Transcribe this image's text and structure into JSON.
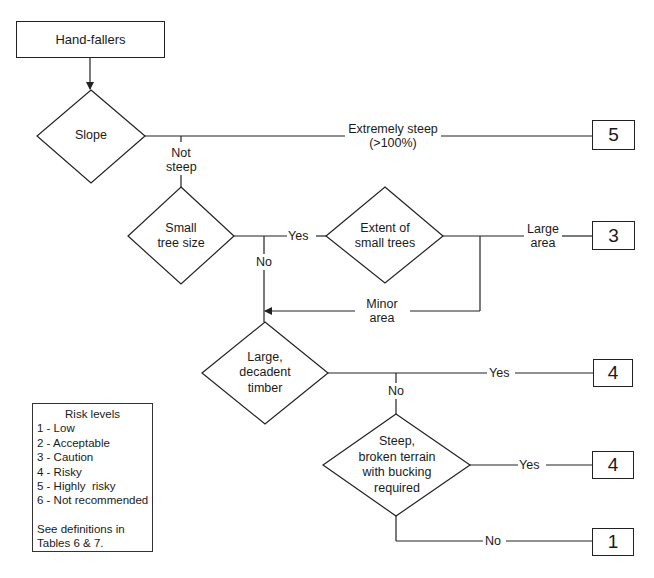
{
  "diagram": {
    "type": "decision-flowchart",
    "start": {
      "label": "Hand-fallers"
    },
    "decisions": [
      {
        "id": "slope",
        "lines": [
          "Slope"
        ]
      },
      {
        "id": "small-tree-size",
        "lines": [
          "Small",
          "tree size"
        ]
      },
      {
        "id": "extent-small-trees",
        "lines": [
          "Extent of",
          "small trees"
        ]
      },
      {
        "id": "large-decadent-timber",
        "lines": [
          "Large,",
          "decadent",
          "timber"
        ]
      },
      {
        "id": "steep-broken-terrain",
        "lines": [
          "Steep,",
          "broken terrain",
          "with bucking",
          "required"
        ]
      }
    ],
    "edge_labels": {
      "extremely_steep_1": "Extremely steep",
      "extremely_steep_2": "(>100%)",
      "not_steep_1": "Not",
      "not_steep_2": "steep",
      "small_yes": "Yes",
      "small_no": "No",
      "large_area_1": "Large",
      "large_area_2": "area",
      "minor_area_1": "Minor",
      "minor_area_2": "area",
      "decadent_yes": "Yes",
      "decadent_no": "No",
      "terrain_yes": "Yes",
      "terrain_no": "No"
    },
    "results": {
      "extremely_steep": "5",
      "large_area": "3",
      "decadent_yes": "4",
      "terrain_yes": "4",
      "terrain_no": "1"
    },
    "edges": [
      {
        "from": "Hand-fallers",
        "to": "Slope"
      },
      {
        "from": "Slope",
        "to": "5",
        "label": "Extremely steep (>100%)"
      },
      {
        "from": "Slope",
        "to": "Small tree size",
        "label": "Not steep"
      },
      {
        "from": "Small tree size",
        "to": "Extent of small trees",
        "label": "Yes"
      },
      {
        "from": "Small tree size",
        "to": "Large, decadent timber",
        "label": "No"
      },
      {
        "from": "Extent of small trees",
        "to": "3",
        "label": "Large area"
      },
      {
        "from": "Extent of small trees",
        "to": "Large, decadent timber",
        "label": "Minor area"
      },
      {
        "from": "Large, decadent timber",
        "to": "4",
        "label": "Yes"
      },
      {
        "from": "Large, decadent timber",
        "to": "Steep, broken terrain with bucking required",
        "label": "No"
      },
      {
        "from": "Steep, broken terrain with bucking required",
        "to": "4",
        "label": "Yes"
      },
      {
        "from": "Steep, broken terrain with bucking required",
        "to": "1",
        "label": "No"
      }
    ]
  },
  "legend": {
    "title": "Risk levels",
    "items": [
      "1 - Low",
      "2 - Acceptable",
      "3 - Caution",
      "4 - Risky",
      "5 - Highly  risky",
      "6 - Not recommended"
    ],
    "note_1": "See definitions in",
    "note_2": "Tables 6 & 7."
  },
  "colors": {
    "line": "#222222",
    "background": "#ffffff",
    "text": "#1a1a1a"
  }
}
